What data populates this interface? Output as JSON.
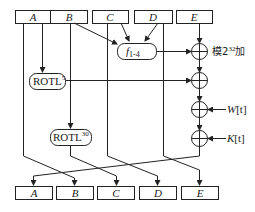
{
  "diagram": {
    "inputs": [
      {
        "id": "A",
        "label": "A"
      },
      {
        "id": "B",
        "label": "B"
      },
      {
        "id": "C",
        "label": "C"
      },
      {
        "id": "D",
        "label": "D"
      },
      {
        "id": "E",
        "label": "E"
      }
    ],
    "outputs": [
      {
        "id": "A",
        "label": "A"
      },
      {
        "id": "B",
        "label": "B"
      },
      {
        "id": "C",
        "label": "C"
      },
      {
        "id": "D",
        "label": "D"
      },
      {
        "id": "E",
        "label": "E"
      }
    ],
    "function": {
      "label": "f",
      "subscript": "1-4"
    },
    "rotl5": {
      "label": "ROTL",
      "superscript": "5"
    },
    "rotl30": {
      "label": "ROTL",
      "superscript": "30"
    },
    "adder_label": {
      "prefix": "模2",
      "superscript": "32",
      "suffix": "加"
    },
    "w_input": {
      "label": "W",
      "index": "[t]"
    },
    "k_input": {
      "label": "K",
      "index": "[t]"
    },
    "colors": {
      "stroke": "#222222",
      "background": "#ffffff"
    }
  }
}
